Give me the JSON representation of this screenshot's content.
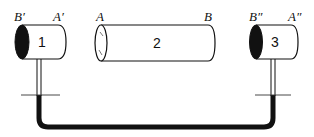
{
  "diagram": {
    "colors": {
      "ink": "#111111",
      "background": "#ffffff"
    },
    "cylinders": [
      {
        "id": "1",
        "number": "1",
        "left_label": "B′",
        "right_label": "A′",
        "left_face": "filled-dark"
      },
      {
        "id": "2",
        "number": "2",
        "left_label": "A",
        "right_label": "B",
        "left_face": "open-hatched"
      },
      {
        "id": "3",
        "number": "3",
        "left_label": "B″",
        "right_label": "A″",
        "left_face": "filled-dark"
      }
    ],
    "tube": {
      "description": "U-shaped connecting tube between cylinder 1 and cylinder 3 stems, partially filled with dark liquid",
      "liquid_level_marker": "horizontal tick marks on each stem"
    }
  }
}
